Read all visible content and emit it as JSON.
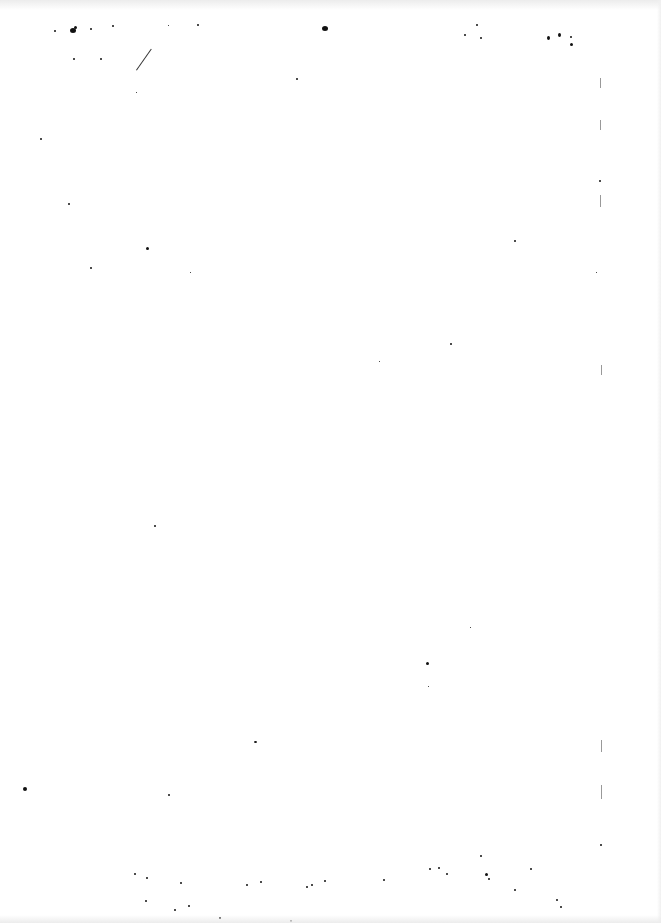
{
  "document": {
    "type": "scanned blank page",
    "content_text": "",
    "background_color": "#ffffff",
    "noise_color": "#111111"
  }
}
